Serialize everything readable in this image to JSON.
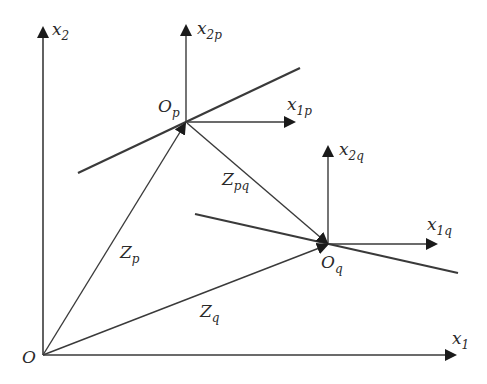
{
  "figure": {
    "type": "coordinate-frames-diagram",
    "colors": {
      "ink": "#2a2a2a",
      "line": "#3a3a3a",
      "background": "#ffffff"
    }
  },
  "frames": {
    "global": {
      "origin_label": "O",
      "x_axis": {
        "base": "x",
        "sub": "1"
      },
      "y_axis": {
        "base": "x",
        "sub": "2"
      }
    },
    "p": {
      "origin_label": {
        "base": "O",
        "sub": "p"
      },
      "x_axis": {
        "base": "x",
        "sub": "1p"
      },
      "y_axis": {
        "base": "x",
        "sub": "2p"
      }
    },
    "q": {
      "origin_label": {
        "base": "O",
        "sub": "q"
      },
      "x_axis": {
        "base": "x",
        "sub": "1q"
      },
      "y_axis": {
        "base": "x",
        "sub": "2q"
      }
    }
  },
  "vectors": {
    "zp": {
      "base": "Z",
      "sub": "p",
      "from": "O",
      "to": "Op"
    },
    "zq": {
      "base": "Z",
      "sub": "q",
      "from": "O",
      "to": "Oq"
    },
    "zpq": {
      "base": "Z",
      "sub": "pq",
      "from": "Op",
      "to": "Oq"
    }
  },
  "lines": {
    "line_p": "line through Op",
    "line_q": "line through Oq"
  }
}
